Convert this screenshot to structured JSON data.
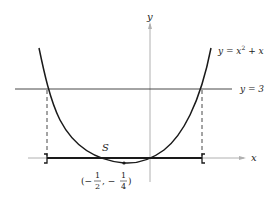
{
  "figure": {
    "type": "function-graph",
    "axes": {
      "x_label": "x",
      "y_label": "y",
      "axis_color": "#aaaaaa"
    },
    "curve": {
      "label": "y = x² + x",
      "label_parts": {
        "lhs": "y = x",
        "exp": "2",
        "rhs": " + x"
      },
      "color": "#1a1a1a"
    },
    "horizontal_line": {
      "label": "y = 3",
      "color": "#333333"
    },
    "region": {
      "label": "S",
      "bracket_left": "]",
      "bracket_right": "["
    },
    "vertex": {
      "label": "(−1/2, −1/4)",
      "open": "(−",
      "frac1_num": "1",
      "frac1_den": "2",
      "sep": ", −",
      "frac2_num": "1",
      "frac2_den": "4",
      "close": ")"
    }
  }
}
